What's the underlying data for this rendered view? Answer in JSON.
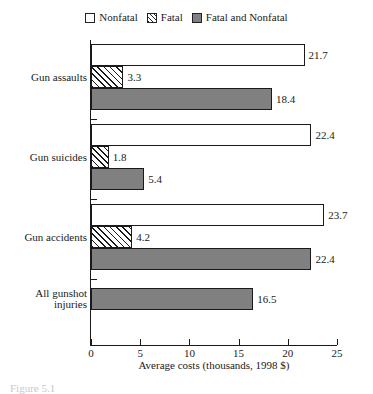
{
  "legend": {
    "position": "top-center",
    "items": [
      {
        "label": "Nonfatal",
        "swatch": "white-box-icon",
        "key": "nonfatal"
      },
      {
        "label": "Fatal",
        "swatch": "hatched-box-icon",
        "key": "fatal"
      },
      {
        "label": "Fatal and Nonfatal",
        "swatch": "gray-box-icon",
        "key": "both"
      }
    ]
  },
  "axis": {
    "ticks": [
      "0",
      "5",
      "10",
      "15",
      "20",
      "25"
    ],
    "xlabel": "Average costs (thousands, 1998 $)"
  },
  "caption": "Figure 5.1",
  "colors": {
    "nonfatal": "#ffffff",
    "fatal": "#ffffff",
    "both": "#808080",
    "outline": "#1a1a1a",
    "text": "#1a1a1a"
  },
  "chart_data": {
    "type": "bar",
    "orientation": "horizontal",
    "title": "",
    "xlabel": "Average costs (thousands, 1998 $)",
    "ylabel": "",
    "xlim": [
      0,
      25
    ],
    "xticks": [
      0,
      5,
      10,
      15,
      20,
      25
    ],
    "grid": false,
    "legend_position": "top-center",
    "categories": [
      "Gun assaults",
      "Gun suicides",
      "Gun accidents",
      "All gunshot injuries"
    ],
    "series": [
      {
        "name": "Nonfatal",
        "values": [
          21.7,
          22.4,
          23.7,
          null
        ]
      },
      {
        "name": "Fatal",
        "values": [
          3.3,
          1.8,
          4.2,
          null
        ]
      },
      {
        "name": "Fatal and Nonfatal",
        "values": [
          18.4,
          5.4,
          22.4,
          16.5
        ]
      }
    ],
    "bars": [
      {
        "category": "Gun assaults",
        "series": "Nonfatal",
        "value": 21.7,
        "label": "21.7"
      },
      {
        "category": "Gun assaults",
        "series": "Fatal",
        "value": 3.3,
        "label": "3.3"
      },
      {
        "category": "Gun assaults",
        "series": "Fatal and Nonfatal",
        "value": 18.4,
        "label": "18.4"
      },
      {
        "category": "Gun suicides",
        "series": "Nonfatal",
        "value": 22.4,
        "label": "22.4"
      },
      {
        "category": "Gun suicides",
        "series": "Fatal",
        "value": 1.8,
        "label": "1.8"
      },
      {
        "category": "Gun suicides",
        "series": "Fatal and Nonfatal",
        "value": 5.4,
        "label": "5.4"
      },
      {
        "category": "Gun accidents",
        "series": "Nonfatal",
        "value": 23.7,
        "label": "23.7"
      },
      {
        "category": "Gun accidents",
        "series": "Fatal",
        "value": 4.2,
        "label": "4.2"
      },
      {
        "category": "Gun accidents",
        "series": "Fatal and Nonfatal",
        "value": 22.4,
        "label": "22.4"
      },
      {
        "category": "All gunshot injuries",
        "series": "Fatal and Nonfatal",
        "value": 16.5,
        "label": "16.5"
      }
    ]
  },
  "layout": {
    "plot_left": 91,
    "plot_top": 40,
    "plot_width": 246,
    "plot_height": 305,
    "bar_height": 22,
    "groups": [
      {
        "category": "Gun assaults",
        "lines": [
          "Gun assaults"
        ],
        "top": 4,
        "bars": [
          "Nonfatal",
          "Fatal",
          "Fatal and Nonfatal"
        ]
      },
      {
        "category": "Gun suicides",
        "lines": [
          "Gun suicides"
        ],
        "top": 84,
        "bars": [
          "Nonfatal",
          "Fatal",
          "Fatal and Nonfatal"
        ]
      },
      {
        "category": "Gun accidents",
        "lines": [
          "Gun accidents"
        ],
        "top": 164,
        "bars": [
          "Nonfatal",
          "Fatal",
          "Fatal and Nonfatal"
        ]
      },
      {
        "category": "All gunshot injuries",
        "lines": [
          "All gunshot",
          "injuries"
        ],
        "top": 248,
        "bars": [
          "Fatal and Nonfatal"
        ]
      }
    ]
  }
}
